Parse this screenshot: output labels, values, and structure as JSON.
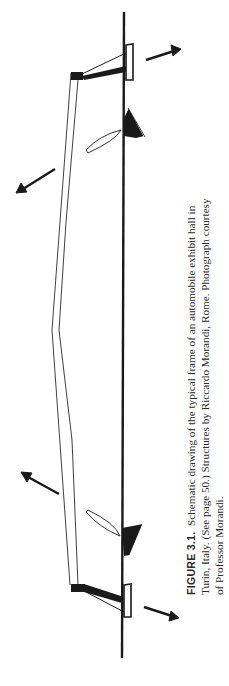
{
  "figure": {
    "label": "FIGURE 3.1.",
    "caption_lines": [
      "Schematic drawing of the typical frame of an automobile exhibit hall in",
      "Turin, Italy. (See page 50.) Structures by Riccardo Morandi, Rome. Photograph courtesy",
      "of Professor Morandi."
    ],
    "drawing_description": "Schematic drawing of a frame with a long spanning beam, two cantilevered supports on a vertical ground line, and four force arrows"
  }
}
